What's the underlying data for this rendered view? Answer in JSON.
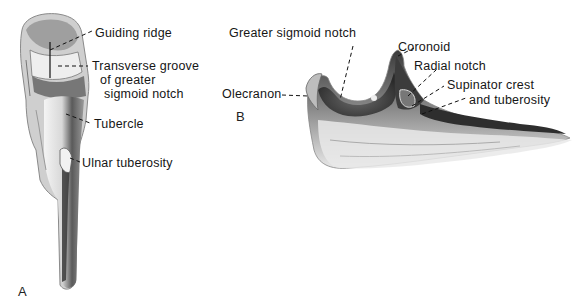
{
  "figure": {
    "panel_a": {
      "letter": "A",
      "labels": {
        "guiding_ridge": "Guiding ridge",
        "transverse_groove_line1": "Transverse groove",
        "transverse_groove_line2": "of greater",
        "transverse_groove_line3": "sigmoid notch",
        "tubercle": "Tubercle",
        "ulnar_tuberosity": "Ulnar tuberosity"
      }
    },
    "panel_b": {
      "letter": "B",
      "labels": {
        "greater_sigmoid_notch": "Greater sigmoid notch",
        "olecranon": "Olecranon",
        "coronoid": "Coronoid",
        "radial_notch": "Radial notch",
        "supinator_line1": "Supinator crest",
        "supinator_line2": "and tuberosity"
      }
    }
  }
}
